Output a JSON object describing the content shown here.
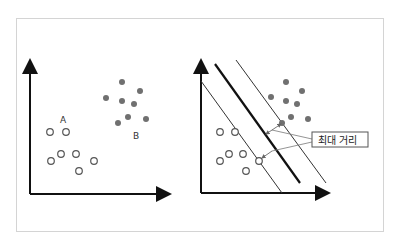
{
  "diagram": {
    "left_panel": {
      "class_a_label": "A",
      "class_b_label": "B",
      "class_a_points": [
        [
          50,
          132
        ],
        [
          66,
          132
        ],
        [
          51,
          161
        ],
        [
          61,
          154
        ],
        [
          76,
          154
        ],
        [
          94,
          161
        ],
        [
          79,
          171
        ]
      ],
      "class_b_points": [
        [
          122,
          82
        ],
        [
          106,
          98
        ],
        [
          122,
          101
        ],
        [
          140,
          91
        ],
        [
          134,
          104
        ],
        [
          128,
          117
        ],
        [
          118,
          123
        ],
        [
          146,
          119
        ]
      ]
    },
    "right_panel": {
      "class_a_points": [
        [
          220,
          132
        ],
        [
          235,
          132
        ],
        [
          220,
          161
        ],
        [
          229,
          154
        ],
        [
          243,
          154
        ],
        [
          259,
          161
        ],
        [
          246,
          171
        ]
      ],
      "class_b_points": [
        [
          286,
          82
        ],
        [
          271,
          97
        ],
        [
          286,
          101
        ],
        [
          302,
          91
        ],
        [
          297,
          104
        ],
        [
          291,
          117
        ],
        [
          308,
          119
        ]
      ],
      "support_vector_a": [
        259,
        161
      ],
      "support_vector_b": [
        282,
        123
      ],
      "callout_label": "최대 거리"
    },
    "colors": {
      "axis": "#111111",
      "filled_point": "#707070",
      "hollow_point_stroke": "#555555",
      "frame_border": "#d4d4d4",
      "margin_line": "#333333",
      "hyperplane": "#111111",
      "arrow_line": "#888888"
    }
  }
}
